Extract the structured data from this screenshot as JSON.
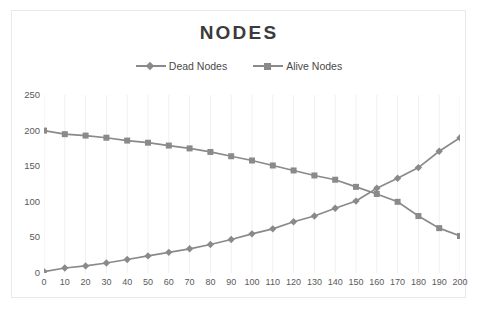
{
  "chart_data": {
    "type": "line",
    "title": "NODES",
    "xlabel": "",
    "ylabel": "",
    "grid": "vertical",
    "legend_position": "top-center",
    "xlim": [
      0,
      200
    ],
    "ylim": [
      0,
      250
    ],
    "yticks": [
      0,
      50,
      100,
      150,
      200,
      250
    ],
    "x": [
      0,
      10,
      20,
      30,
      40,
      50,
      60,
      70,
      80,
      90,
      100,
      110,
      120,
      130,
      140,
      150,
      160,
      170,
      180,
      190,
      200
    ],
    "xticklabels": [
      "0",
      "10",
      "20",
      "30",
      "40",
      "50",
      "60",
      "70",
      "80",
      "90",
      "100",
      "110",
      "120",
      "130",
      "140",
      "150",
      "160",
      "170",
      "180",
      "190",
      "200"
    ],
    "series": [
      {
        "name": "Dead Nodes",
        "marker": "diamond",
        "color": "#8a8a8a",
        "values": [
          2,
          7,
          10,
          14,
          19,
          24,
          29,
          34,
          40,
          47,
          55,
          62,
          72,
          80,
          91,
          101,
          119,
          133,
          148,
          171,
          190
        ]
      },
      {
        "name": "Alive Nodes",
        "marker": "square",
        "color": "#8a8a8a",
        "values": [
          200,
          195,
          193,
          190,
          186,
          183,
          179,
          175,
          170,
          164,
          158,
          151,
          144,
          137,
          131,
          121,
          111,
          100,
          80,
          63,
          52
        ]
      }
    ]
  },
  "legend": {
    "entries": [
      {
        "label": "Dead Nodes"
      },
      {
        "label": "Alive Nodes"
      }
    ]
  },
  "colors": {
    "line": "#8a8a8a",
    "title_text": "#3b3b3b",
    "axis_text": "#5a5a5a",
    "gridline": "#f0f0f0",
    "frame": "#e9e9e9",
    "background": "#ffffff"
  }
}
